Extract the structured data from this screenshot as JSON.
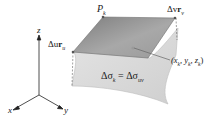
{
  "figure": {
    "type": "surface-patch-diagram",
    "axes": {
      "x": "x",
      "y": "y",
      "z": "z"
    },
    "labels": {
      "corner_point": "P",
      "corner_point_sub": "k",
      "vector_u": "Δu",
      "vector_u_r": "r",
      "vector_u_sub": "u",
      "vector_v": "Δv",
      "vector_v_r": "r",
      "vector_v_sub": "v",
      "sample_point": "(x",
      "sample_point_full": "(x_k, y_k, z_k)",
      "area_lhs": "Δσ",
      "area_lhs_sub": "k",
      "area_eq": " = Δσ",
      "area_rhs_sub": "uv"
    },
    "colors": {
      "tangent_plane": "#8f8f8f",
      "surface": "#d6d6d6",
      "surface_edge": "#bdbdbd",
      "text": "#1a1a1a"
    }
  }
}
